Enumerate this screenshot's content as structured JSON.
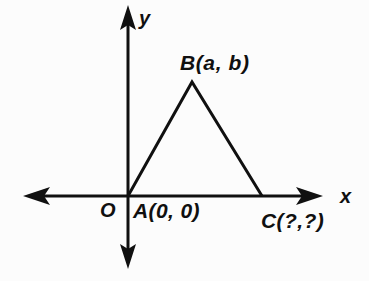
{
  "figure": {
    "kind": "coordinate-plane-triangle-diagram",
    "background_color": "#fcfcfc",
    "ink_color": "#101010"
  },
  "axes": {
    "x_label": "x",
    "y_label": "y",
    "origin_label": "O",
    "x_axis_geometry": {
      "y": 196,
      "x_start": 24,
      "x_end": 322,
      "arrows": "both"
    },
    "y_axis_geometry": {
      "x": 128,
      "y_start": 6,
      "y_end": 268,
      "arrows": "both"
    }
  },
  "triangle": {
    "vertices": [
      {
        "name": "A",
        "label": "A(0, 0)",
        "px": {
          "x": 128,
          "y": 196
        }
      },
      {
        "name": "B",
        "label": "B(a, b)",
        "px": {
          "x": 192,
          "y": 82
        }
      },
      {
        "name": "C",
        "label": "C(?,?)",
        "px": {
          "x": 262,
          "y": 196
        }
      }
    ],
    "stroke_width": 3
  },
  "labels": {
    "vertex_a": "A(0, 0)",
    "vertex_b": "B(a, b)",
    "vertex_c": "C(?,?)",
    "origin": "O",
    "axis_x": "x",
    "axis_y": "y"
  }
}
